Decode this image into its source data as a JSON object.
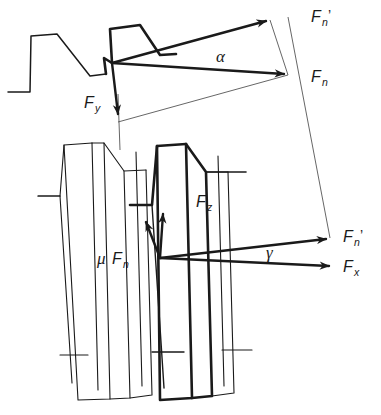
{
  "figure": {
    "background_color": "#ffffff",
    "line_color": "#1a1a1a",
    "thin_line_color": "#555555",
    "width": 381,
    "height": 415
  },
  "labels": {
    "fn_prime_upper": {
      "base": "F",
      "sub": "n",
      "prime": "’",
      "x": 311,
      "y": 22
    },
    "fn_upper": {
      "base": "F",
      "sub": "n",
      "prime": "",
      "x": 311,
      "y": 82
    },
    "fy": {
      "base": "F",
      "sub": "y",
      "prime": "",
      "x": 84,
      "y": 108
    },
    "alpha": {
      "text": "α",
      "x": 216,
      "y": 62
    },
    "fz": {
      "base": "F",
      "sub": "z",
      "prime": "",
      "x": 196,
      "y": 207
    },
    "mu_fn": {
      "mu": "μ",
      "base": "F",
      "sub": "n",
      "x": 97,
      "y": 264
    },
    "fn_prime_lower": {
      "base": "F",
      "sub": "n",
      "prime": "’",
      "x": 343,
      "y": 242
    },
    "fx": {
      "base": "F",
      "sub": "x",
      "prime": "",
      "x": 343,
      "y": 272
    },
    "gamma": {
      "text": "γ",
      "x": 266,
      "y": 258
    }
  },
  "vectors": [
    {
      "name": "Fn-prime-upper",
      "from": [
        112,
        63
      ],
      "to": [
        270,
        20
      ],
      "style": "bold-arrow"
    },
    {
      "name": "Fn-upper",
      "from": [
        112,
        63
      ],
      "to": [
        288,
        75
      ],
      "style": "bold-arrow"
    },
    {
      "name": "Fy",
      "from": [
        112,
        63
      ],
      "to": [
        118,
        122
      ],
      "style": "bold-arrow"
    },
    {
      "name": "Fn-prime-lower",
      "from": [
        160,
        258
      ],
      "to": [
        330,
        238
      ],
      "style": "bold-arrow"
    },
    {
      "name": "Fx",
      "from": [
        160,
        258
      ],
      "to": [
        333,
        266
      ],
      "style": "bold-arrow"
    },
    {
      "name": "Fz-component",
      "from": [
        160,
        258
      ],
      "to": [
        163,
        208
      ],
      "style": "bold-arrow"
    },
    {
      "name": "mu-Fn-component",
      "from": [
        160,
        258
      ],
      "to": [
        145,
        217
      ],
      "style": "bold-arrow"
    }
  ],
  "construction_lines": [
    {
      "name": "fn-tip-to-fy-tip",
      "from": [
        288,
        75
      ],
      "to": [
        118,
        122
      ]
    },
    {
      "name": "right-vertical-drop",
      "from": [
        288,
        17
      ],
      "to": [
        330,
        238
      ]
    }
  ],
  "angles": [
    {
      "name": "alpha",
      "symbol": "α",
      "between": [
        "Fn-prime-upper",
        "Fn-upper"
      ]
    },
    {
      "name": "gamma",
      "symbol": "γ",
      "between": [
        "Fn-prime-lower",
        "Fx"
      ]
    }
  ]
}
